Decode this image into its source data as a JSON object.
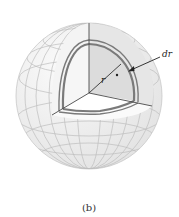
{
  "figure": {
    "caption": "(b)",
    "labels": {
      "radius": "r",
      "thickness": "dr"
    },
    "colors": {
      "sphere_fill": "#f1f1f1",
      "grid_lines": "#b9b9b9",
      "cut_face": "#e4e4e4",
      "inner_face": "#fafafa",
      "shell": "#7a7a7a",
      "edges": "#4a4a4a"
    }
  }
}
